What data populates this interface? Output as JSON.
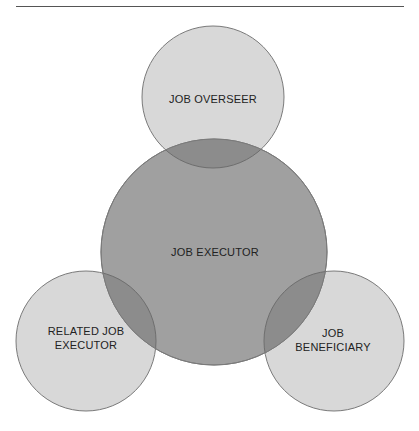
{
  "diagram": {
    "type": "venn",
    "colors": {
      "outer_fill": "#d8d8d8",
      "center_fill": "#a0a0a0",
      "stroke": "#7a7a7a",
      "text": "#222222",
      "rule": "#555555"
    },
    "nodes": [
      {
        "id": "job-overseer",
        "label": "JOB OVERSEER",
        "lines": [
          "JOB OVERSEER"
        ],
        "cx": 213,
        "cy": 97,
        "r": 71
      },
      {
        "id": "job-executor",
        "label": "JOB EXECUTOR",
        "lines": [
          "JOB EXECUTOR"
        ],
        "cx": 214,
        "cy": 252,
        "r": 113
      },
      {
        "id": "related-job-executor",
        "label": "RELATED JOB EXECUTOR",
        "lines": [
          "RELATED JOB",
          "EXECUTOR"
        ],
        "cx": 86,
        "cy": 341,
        "r": 70
      },
      {
        "id": "job-beneficiary",
        "label": "JOB BENEFICIARY",
        "lines": [
          "JOB",
          "BENEFICIARY"
        ],
        "cx": 334,
        "cy": 341,
        "r": 70
      }
    ]
  }
}
